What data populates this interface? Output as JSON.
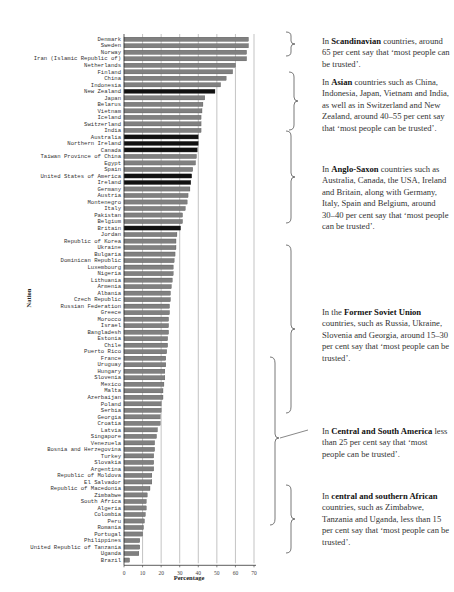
{
  "chart_data": {
    "type": "bar",
    "orientation": "horizontal",
    "title": "",
    "xlabel": "Percentage",
    "ylabel": "Nation",
    "xlim": [
      0,
      70
    ],
    "xticks": [
      0,
      10,
      20,
      30,
      40,
      50,
      60,
      70
    ],
    "grid": "vertical",
    "legend": null,
    "colors": {
      "default": "#808080",
      "highlight": "#111111",
      "outline": "#444444"
    },
    "categories": [
      "Denmark",
      "Sweden",
      "Norway",
      "Iran (Islamic Republic of)",
      "Netherlands",
      "Finland",
      "China",
      "Indonesia",
      "New Zealand",
      "Japan",
      "Belarus",
      "Vietnam",
      "Iceland",
      "Switzerland",
      "India",
      "Australia",
      "Northern Ireland",
      "Canada",
      "Taiwan Province of China",
      "Egypt",
      "Spain",
      "United States of America",
      "Ireland",
      "Germany",
      "Austria",
      "Montenegro",
      "Italy",
      "Pakistan",
      "Belgium",
      "Britain",
      "Jordan",
      "Republic of Korea",
      "Ukraine",
      "Bulgaria",
      "Dominican Republic",
      "Luxembourg",
      "Nigeria",
      "Lithuania",
      "Armenia",
      "Albania",
      "Czech Republic",
      "Russian Federation",
      "Greece",
      "Morocco",
      "Israel",
      "Bangladesh",
      "Estonia",
      "Chile",
      "Puerto Rico",
      "France",
      "Uruguay",
      "Hungary",
      "Slovenia",
      "Mexico",
      "Malta",
      "Azerbaijan",
      "Poland",
      "Serbia",
      "Georgia",
      "Croatia",
      "Latvia",
      "Singapore",
      "Venezuela",
      "Bosnia and Herzegovina",
      "Turkey",
      "Slovakia",
      "Argentina",
      "Republic of Moldova",
      "El Salvador",
      "Republic of Macedonia",
      "Zimbabwe",
      "South Africa",
      "Algeria",
      "Colombia",
      "Peru",
      "Romania",
      "Portugal",
      "Philippines",
      "United Republic of Tanzania",
      "Uganda",
      "Brazil"
    ],
    "values": [
      67,
      67,
      66,
      66,
      60,
      58.5,
      55,
      52,
      49,
      43.5,
      42.5,
      42,
      41.5,
      41.5,
      41.5,
      40,
      40,
      39.5,
      39,
      38.5,
      37,
      36.5,
      36,
      35.5,
      34.5,
      34,
      33,
      31.5,
      31.5,
      30.5,
      28.5,
      28,
      28,
      27.5,
      27,
      26.5,
      26.5,
      26,
      25.5,
      25,
      25,
      24.5,
      24.5,
      24,
      24,
      24,
      23.5,
      23.5,
      23,
      22.5,
      22.5,
      22,
      22,
      21.5,
      21,
      21,
      20,
      20,
      19.5,
      19.5,
      18,
      17.5,
      16.5,
      16.5,
      16,
      16,
      16,
      15,
      15,
      14,
      12.5,
      12,
      12,
      11.5,
      11,
      10.5,
      10,
      8.5,
      8.5,
      8,
      3
    ],
    "highlighted": [
      "New Zealand",
      "Australia",
      "Northern Ireland",
      "Canada",
      "United States of America",
      "Ireland",
      "Britain"
    ]
  },
  "annotations": [
    {
      "pre": "In ",
      "bold": "Scandinavian",
      "post": " countries, around 65 per cent say that ‘most people can be trusted’."
    },
    {
      "pre": "In ",
      "bold": "Asian",
      "post": " countries such as China, Indonesia, Japan, Vietnam and India, as well as in Switzerland and New Zealand, around 40–55 per cent say that ‘most people can be trusted’."
    },
    {
      "pre": "In ",
      "bold": "Anglo-Saxon",
      "post": " countries such as Australia, Canada, the USA, Ireland and Britain, along with Germany, Italy, Spain and Belgium, around  30–40 per cent say that ‘most people can be trusted’."
    },
    {
      "pre": "In the ",
      "bold": "Former Soviet Union",
      "post": " countries, such as Russia, Ukraine, Slovenia and Georgia, around 15–30 per cent say that ‘most people can be trusted’."
    },
    {
      "pre": "In ",
      "bold": "Central and South America",
      "post": " less than 25 per cent say that ‘most people can be trusted’."
    },
    {
      "pre": "In ",
      "bold": "central and southern African",
      "post": " countries, such as Zimbabwe, Tanzania and Uganda, less than 15 per cent say that ‘most people can be trusted’."
    }
  ]
}
